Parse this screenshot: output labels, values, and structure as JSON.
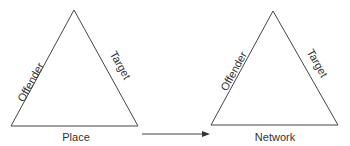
{
  "diagram": {
    "left_triangle": {
      "left_side": "Offender",
      "right_side": "Target",
      "base": "Place"
    },
    "right_triangle": {
      "left_side": "Offender",
      "right_side": "Target",
      "base": "Network"
    },
    "connector": "arrow-right",
    "stroke_color": "#444444"
  }
}
